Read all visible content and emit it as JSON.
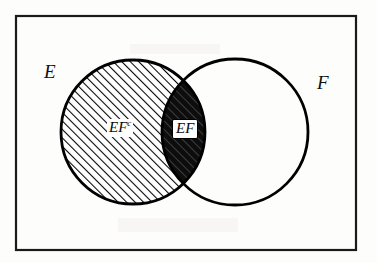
{
  "figure": {
    "kind": "venn-diagram",
    "background_color": "#fdfdfc",
    "ink_color": "#000000",
    "frame": {
      "name": "sample-space-rectangle",
      "x": 15,
      "y": 15,
      "width": 341,
      "height": 235,
      "stroke_width": 2
    },
    "circles": [
      {
        "id": "E",
        "label": "E",
        "cx": 133,
        "cy": 132,
        "r": 72,
        "fill": "diagonal-hatch",
        "stroke_width": 2.6
      },
      {
        "id": "F",
        "label": "F",
        "cx": 235,
        "cy": 132,
        "r": 73,
        "fill": "none",
        "stroke_width": 2.6
      }
    ],
    "regions": [
      {
        "id": "EFc",
        "label": "EF",
        "superscript": "c",
        "shading": "diagonal-hatch",
        "label_x": 107,
        "label_y": 119,
        "label_boxed": false,
        "meaning": "E minus F"
      },
      {
        "id": "EF",
        "label": "EF",
        "superscript": "",
        "shading": "solid-black-with-hatch",
        "label_x": 172,
        "label_y": 119,
        "label_boxed": true,
        "meaning": "intersection of E and F"
      }
    ],
    "hatch": {
      "angle_degrees": 45,
      "direction": "lower-left-to-upper-right",
      "spacing_px": 6,
      "line_width_px": 2.1,
      "color": "#000000"
    },
    "labels": {
      "set_e": "E",
      "set_f": "F",
      "region_e_not_f": "EF",
      "region_e_not_f_sup": "c",
      "region_intersection": "EF"
    }
  }
}
